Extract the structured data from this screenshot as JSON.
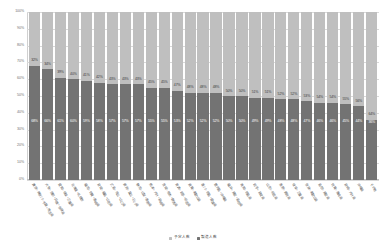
{
  "chart_data": {
    "type": "bar",
    "title": "",
    "subtitle": "",
    "xlabel": "",
    "ylabel": "",
    "stacked": true,
    "stack_mode": "percent",
    "grid": true,
    "legend_position": "bottom",
    "ylim": [
      0,
      100
    ],
    "ytick_labels": [
      "100%",
      "90%",
      "80%",
      "70%",
      "60%",
      "50%",
      "40%",
      "30%",
      "20%",
      "10%",
      "0%"
    ],
    "ytick_values": [
      100,
      90,
      80,
      70,
      60,
      50,
      40,
      30,
      20,
      10,
      0
    ],
    "categories": [
      "東京・神奈川・千葉・埼玉県",
      "大阪・京都・兵庫・奈良県",
      "愛知・岐阜・三重県",
      "北海道・札幌市",
      "福岡・佐賀・長崎県",
      "宮城・福島・山形県",
      "広島・岡山・山口県",
      "新潟・富山・石川県",
      "静岡・山梨・長野県",
      "熊本・大分・宮崎県",
      "茨城・栃木・群馬県",
      "青森・岩手・秋田県",
      "滋賀・和歌山県",
      "香川・徳島・愛媛県",
      "鹿児島・沖縄県",
      "福井・鳥取・島根県",
      "高知・徳島県",
      "岩手・宮城県",
      "山形・秋田県",
      "長野・新潟県",
      "岐阜・三重県",
      "奈良・和歌山県",
      "島根・鳥取県",
      "佐賀・長崎県",
      "宮崎・大分県",
      "沖縄県",
      "その他"
    ],
    "series": [
      {
        "name": "製造人数",
        "color": "#737373",
        "values": [
          68,
          66,
          61,
          60,
          59,
          58,
          57,
          57,
          57,
          55,
          55,
          53,
          52,
          52,
          52,
          50,
          50,
          49,
          49,
          48,
          48,
          47,
          46,
          46,
          45,
          44,
          36
        ],
        "labels": [
          "68%",
          "66%",
          "61%",
          "60%",
          "59%",
          "58%",
          "57%",
          "57%",
          "57%",
          "55%",
          "55%",
          "53%",
          "52%",
          "52%",
          "52%",
          "50%",
          "50%",
          "49%",
          "49%",
          "48%",
          "48%",
          "47%",
          "46%",
          "46%",
          "45%",
          "44%",
          "36%"
        ]
      },
      {
        "name": "予定人数",
        "color": "#bfbfbf",
        "values": [
          32,
          34,
          39,
          40,
          41,
          42,
          43,
          43,
          43,
          45,
          45,
          47,
          48,
          48,
          48,
          50,
          50,
          51,
          51,
          52,
          52,
          53,
          54,
          54,
          55,
          56,
          64
        ],
        "labels": [
          "32%",
          "34%",
          "39%",
          "40%",
          "41%",
          "42%",
          "43%",
          "43%",
          "43%",
          "45%",
          "45%",
          "47%",
          "48%",
          "48%",
          "48%",
          "50%",
          "50%",
          "51%",
          "51%",
          "52%",
          "52%",
          "53%",
          "54%",
          "54%",
          "55%",
          "56%",
          "64%"
        ]
      }
    ]
  },
  "legend": {
    "items": [
      {
        "label": "予定人数",
        "color": "#bfbfbf"
      },
      {
        "label": "製造人数",
        "color": "#737373"
      }
    ]
  }
}
